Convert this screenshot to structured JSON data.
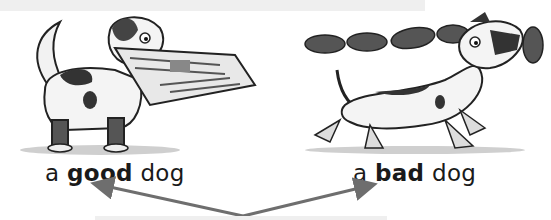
{
  "illustrations": [
    {
      "name": "good-dog",
      "description": "dog carrying newspaper in mouth"
    },
    {
      "name": "bad-dog",
      "description": "dog running off with a string of sausages"
    }
  ],
  "captions": {
    "left": {
      "article": "a",
      "adjective": "good",
      "noun": "dog"
    },
    "right": {
      "article": "a",
      "adjective": "bad",
      "noun": "dog"
    }
  },
  "colors": {
    "arrow": "#6e6e6e",
    "bars": "#efefef",
    "ink": "#1a1a1a"
  }
}
